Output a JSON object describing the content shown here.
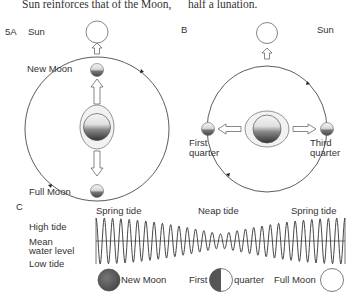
{
  "header_text": {
    "left": "Sun reinforces that of the Moon,",
    "right": "half a lunation."
  },
  "panel_a": {
    "label": "5A",
    "sun_label": "Sun",
    "new_moon_label": "New Moon",
    "full_moon_label": "Full Moon"
  },
  "panel_b": {
    "label": "B",
    "sun_label": "Sun",
    "first_quarter_label_1": "First",
    "first_quarter_label_2": "quarter",
    "third_quarter_label_1": "Third",
    "third_quarter_label_2": "quarter"
  },
  "panel_c": {
    "label": "C",
    "y_labels": [
      "High tide",
      "Mean",
      "water level",
      "Low tide"
    ],
    "phase_labels": [
      "Spring tide",
      "Neap tide",
      "Spring tide"
    ],
    "moon_labels": {
      "new_moon": "New Moon",
      "first": "First",
      "quarter": "quarter",
      "full_moon": "Full Moon"
    }
  },
  "colors": {
    "line": "#333333",
    "moon_dark": "#555555",
    "background": "#ffffff"
  }
}
